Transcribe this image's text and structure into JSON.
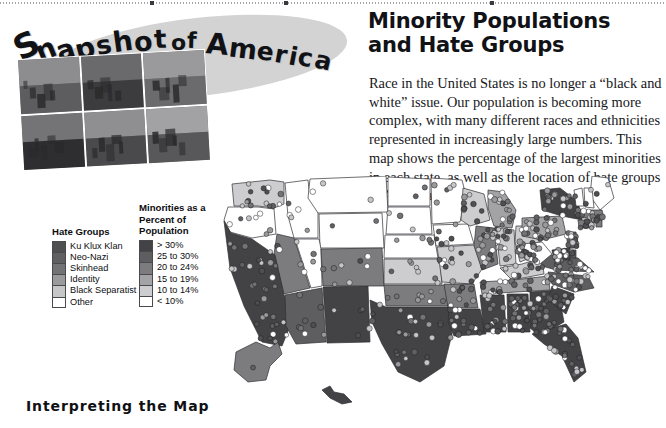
{
  "page": {
    "top_rule": "dotted-rule"
  },
  "logo": {
    "name": "Snapshot of America",
    "words": [
      {
        "text": "S",
        "x": 0,
        "y": 14,
        "size": 34,
        "rot": -26
      },
      {
        "text": "n",
        "x": 22,
        "y": 22,
        "size": 28,
        "rot": -22
      },
      {
        "text": "a",
        "x": 42,
        "y": 22,
        "size": 27,
        "rot": -18
      },
      {
        "text": "p",
        "x": 61,
        "y": 21,
        "size": 28,
        "rot": -14
      },
      {
        "text": "s",
        "x": 82,
        "y": 18,
        "size": 26,
        "rot": -11
      },
      {
        "text": "h",
        "x": 99,
        "y": 14,
        "size": 28,
        "rot": -8
      },
      {
        "text": "o",
        "x": 120,
        "y": 14,
        "size": 27,
        "rot": -5
      },
      {
        "text": "t",
        "x": 140,
        "y": 12,
        "size": 26,
        "rot": -3
      },
      {
        "text": "o",
        "x": 157,
        "y": 18,
        "size": 22,
        "rot": 0
      },
      {
        "text": "f",
        "x": 173,
        "y": 16,
        "size": 22,
        "rot": 2
      },
      {
        "text": "A",
        "x": 192,
        "y": 16,
        "size": 29,
        "rot": 5
      },
      {
        "text": "m",
        "x": 215,
        "y": 21,
        "size": 27,
        "rot": 7
      },
      {
        "text": "e",
        "x": 243,
        "y": 25,
        "size": 25,
        "rot": 9
      },
      {
        "text": "r",
        "x": 261,
        "y": 28,
        "size": 25,
        "rot": 10
      },
      {
        "text": "i",
        "x": 275,
        "y": 30,
        "size": 25,
        "rot": 11
      },
      {
        "text": "c",
        "x": 284,
        "y": 31,
        "size": 25,
        "rot": 12
      },
      {
        "text": "a",
        "x": 301,
        "y": 34,
        "size": 25,
        "rot": 13
      }
    ],
    "photos": [
      {
        "name": "village-valley-photo",
        "sky": "#8d8d8f",
        "land": "#5d5d5f"
      },
      {
        "name": "forest-trees-photo",
        "sky": "#6a6a6c",
        "land": "#3c3c3e"
      },
      {
        "name": "town-street-photo",
        "sky": "#9a9a9c",
        "land": "#6b6b6d"
      },
      {
        "name": "victorian-house-photo",
        "sky": "#747476",
        "land": "#2e2e30"
      },
      {
        "name": "barn-building-photo",
        "sky": "#8f8f91",
        "land": "#4a4a4c"
      },
      {
        "name": "farm-field-photo",
        "sky": "#a2a2a4",
        "land": "#58585a"
      }
    ]
  },
  "article": {
    "title": "Minority Populations and Hate Groups",
    "body": "Race in the United States is no longer a “black and white” issue. Our population is becoming more complex, with many different races and ethnicities represented in increasingly large numbers. This map shows the percentage of the largest minorities in each state, as well as the location of hate groups in America."
  },
  "legends": {
    "hate_groups": {
      "title": "Hate Groups",
      "items": [
        {
          "label": "Ku Klux Klan",
          "color": "#4f4f52"
        },
        {
          "label": "Neo-Nazi",
          "color": "#606063"
        },
        {
          "label": "Skinhead",
          "color": "#737376"
        },
        {
          "label": "Identity",
          "color": "#9a9a9d"
        },
        {
          "label": "Black Separatist",
          "color": "#c6c6c8"
        },
        {
          "label": "Other",
          "color": "#ffffff"
        }
      ]
    },
    "minorities": {
      "title": "Minorities as a\nPercent of\nPopulation",
      "items": [
        {
          "label": "> 30%",
          "color": "#434346"
        },
        {
          "label": "25 to 30%",
          "color": "#5e5e61"
        },
        {
          "label": "20 to 24%",
          "color": "#7c7c7f"
        },
        {
          "label": "15 to 19%",
          "color": "#a3a3a6"
        },
        {
          "label": "10 to 14%",
          "color": "#cdcdcf"
        },
        {
          "label": "< 10%",
          "color": "#ffffff"
        }
      ]
    }
  },
  "section": {
    "heading": "Interpreting the Map"
  },
  "chart_data": {
    "type": "map",
    "title": "Minority Populations and Hate Groups",
    "projection": "usa-albers-simplified",
    "view_box": "0 0 444 236",
    "legend_position": "left",
    "value_scale": [
      {
        "label": "> 30%",
        "color": "#434346"
      },
      {
        "label": "25 to 30%",
        "color": "#5e5e61"
      },
      {
        "label": "20 to 24%",
        "color": "#7c7c7f"
      },
      {
        "label": "15 to 19%",
        "color": "#a3a3a6"
      },
      {
        "label": "10 to 14%",
        "color": "#cdcdcf"
      },
      {
        "label": "< 10%",
        "color": "#ffffff"
      }
    ],
    "states": [
      {
        "code": "WA",
        "bucket": "10 to 14%",
        "color": "#cdcdcf",
        "points": "10,8 48,4 62,6 62,28 52,32 36,30 12,30"
      },
      {
        "code": "OR",
        "bucket": "< 10%",
        "color": "#ffffff",
        "points": "6,31 36,31 52,33 54,58 30,62 8,56 2,44"
      },
      {
        "code": "ID",
        "bucket": "< 10%",
        "color": "#ffffff",
        "points": "63,7 86,4 88,22 96,36 96,62 72,62 66,40"
      },
      {
        "code": "MT",
        "bucket": "< 10%",
        "color": "#ffffff",
        "points": "88,3 164,0 166,36 96,37 86,22"
      },
      {
        "code": "WY",
        "bucket": "< 10%",
        "color": "#ffffff",
        "points": "97,38 160,37 162,72 98,72"
      },
      {
        "code": "NV",
        "bucket": "20 to 24%",
        "color": "#7c7c7f",
        "points": "55,58 72,62 88,112 62,118 52,78"
      },
      {
        "code": "UT",
        "bucket": "< 10%",
        "color": "#ffffff",
        "points": "73,63 97,63 99,73 100,110 89,112"
      },
      {
        "code": "CA",
        "bucket": "> 30%",
        "color": "#434346",
        "points": "2,45 9,57 30,63 53,79 62,119 72,140 60,170 40,166 22,130 8,92"
      },
      {
        "code": "AZ",
        "bucket": "25 to 30%",
        "color": "#5e5e61",
        "points": "63,119 100,112 104,166 74,168 64,150"
      },
      {
        "code": "NM",
        "bucket": "> 30%",
        "color": "#434346",
        "points": "101,111 146,110 148,166 105,167"
      },
      {
        "code": "CO",
        "bucket": "20 to 24%",
        "color": "#7c7c7f",
        "points": "99,73 160,72 162,110 101,110"
      },
      {
        "code": "ND",
        "bucket": "< 10%",
        "color": "#ffffff",
        "points": "166,1 208,3 208,30 166,30"
      },
      {
        "code": "SD",
        "bucket": "< 10%",
        "color": "#ffffff",
        "points": "166,31 208,31 210,58 164,58"
      },
      {
        "code": "NE",
        "bucket": "< 10%",
        "color": "#ffffff",
        "points": "163,59 212,59 216,82 162,82"
      },
      {
        "code": "KS",
        "bucket": "10 to 14%",
        "color": "#cdcdcf",
        "points": "162,83 218,83 220,108 162,108"
      },
      {
        "code": "OK",
        "bucket": "20 to 24%",
        "color": "#7c7c7f",
        "points": "162,109 224,109 226,130 164,130"
      },
      {
        "code": "TX",
        "bucket": "> 30%",
        "color": "#434346",
        "points": "148,124 164,131 226,131 230,158 222,190 198,206 176,196 160,168 150,146"
      },
      {
        "code": "MN",
        "bucket": "< 10%",
        "color": "#ffffff",
        "points": "209,2 240,4 244,20 238,46 210,48"
      },
      {
        "code": "IA",
        "bucket": "< 10%",
        "color": "#ffffff",
        "points": "211,49 246,48 252,68 214,70"
      },
      {
        "code": "MO",
        "bucket": "10 to 14%",
        "color": "#cdcdcf",
        "points": "215,71 254,69 262,90 250,108 220,106 217,84"
      },
      {
        "code": "AR",
        "bucket": "20 to 24%",
        "color": "#7c7c7f",
        "points": "222,108 252,108 256,132 226,132"
      },
      {
        "code": "LA",
        "bucket": "> 30%",
        "color": "#434346",
        "points": "227,133 258,133 264,158 232,160 226,146"
      },
      {
        "code": "WI",
        "bucket": "10 to 14%",
        "color": "#cdcdcf",
        "points": "241,12 262,18 268,44 248,50 239,44"
      },
      {
        "code": "IL",
        "bucket": "20 to 24%",
        "color": "#7c7c7f",
        "points": "254,50 272,52 276,88 260,94 252,70"
      },
      {
        "code": "MI",
        "bucket": "15 to 19%",
        "color": "#a3a3a6",
        "points": "266,14 282,16 294,34 290,52 272,50 266,32"
      },
      {
        "code": "IN",
        "bucket": "10 to 14%",
        "color": "#cdcdcf",
        "points": "274,52 292,54 294,88 278,90"
      },
      {
        "code": "OH",
        "bucket": "10 to 14%",
        "color": "#cdcdcf",
        "points": "294,50 316,50 318,78 298,86 293,66"
      },
      {
        "code": "KY",
        "bucket": "10 to 14%",
        "color": "#cdcdcf",
        "points": "278,92 300,88 320,82 322,98 290,104"
      },
      {
        "code": "TN",
        "bucket": "15 to 19%",
        "color": "#a3a3a6",
        "points": "258,106 292,104 326,100 328,114 260,118"
      },
      {
        "code": "MS",
        "bucket": "> 30%",
        "color": "#434346",
        "points": "258,119 282,119 284,156 262,156"
      },
      {
        "code": "AL",
        "bucket": "> 30%",
        "color": "#434346",
        "points": "285,118 306,118 308,156 286,156"
      },
      {
        "code": "GA",
        "bucket": "> 30%",
        "color": "#434346",
        "points": "308,116 336,114 342,146 318,160 308,152"
      },
      {
        "code": "FL",
        "bucket": "> 30%",
        "color": "#434346",
        "points": "310,158 344,148 356,162 364,196 352,206 340,180 322,168"
      },
      {
        "code": "SC",
        "bucket": "> 30%",
        "color": "#434346",
        "points": "330,110 352,118 344,138 326,124"
      },
      {
        "code": "NC",
        "bucket": "25 to 30%",
        "color": "#5e5e61",
        "points": "326,96 366,100 372,112 352,116 330,108"
      },
      {
        "code": "VA",
        "bucket": "25 to 30%",
        "color": "#5e5e61",
        "points": "318,78 356,82 372,96 334,94 320,90"
      },
      {
        "code": "WV",
        "bucket": "< 10%",
        "color": "#ffffff",
        "points": "300,68 320,66 330,78 318,88 304,84"
      },
      {
        "code": "PA",
        "bucket": "15 to 19%",
        "color": "#a3a3a6",
        "points": "300,42 340,40 344,58 320,64 300,60"
      },
      {
        "code": "NY",
        "bucket": "> 30%",
        "color": "#434346",
        "points": "318,14 338,12 356,26 360,44 340,40 320,34"
      },
      {
        "code": "ME",
        "bucket": "< 10%",
        "color": "#ffffff",
        "points": "370,0 386,2 392,22 378,34 368,20"
      },
      {
        "code": "VT",
        "bucket": "< 10%",
        "color": "#ffffff",
        "points": "352,14 360,12 362,30 354,30"
      },
      {
        "code": "NH",
        "bucket": "< 10%",
        "color": "#ffffff",
        "points": "362,12 370,12 372,32 363,31"
      },
      {
        "code": "MA",
        "bucket": "20 to 24%",
        "color": "#7c7c7f",
        "points": "356,34 380,34 382,42 357,42"
      },
      {
        "code": "CT",
        "bucket": "20 to 24%",
        "color": "#7c7c7f",
        "points": "356,44 372,44 372,52 357,52"
      },
      {
        "code": "RI",
        "bucket": "20 to 24%",
        "color": "#7c7c7f",
        "points": "374,44 380,44 380,51 374,51"
      },
      {
        "code": "NJ",
        "bucket": "25 to 30%",
        "color": "#5e5e61",
        "points": "344,56 354,56 356,72 346,72"
      },
      {
        "code": "DE",
        "bucket": "25 to 30%",
        "color": "#5e5e61",
        "points": "346,74 354,74 354,82 347,82"
      },
      {
        "code": "MD",
        "bucket": "> 30%",
        "color": "#434346",
        "points": "330,74 348,72 348,84 332,84"
      },
      {
        "code": "AK",
        "bucket": "20 to 24%",
        "color": "#7c7c7f",
        "points": "14,176 34,166 48,172 56,166 60,178 48,190 44,204 26,206 12,194"
      },
      {
        "code": "HI",
        "bucket": "> 30%",
        "color": "#434346",
        "points": "100,214 108,210 112,216 122,218 130,226 120,228 108,222"
      }
    ],
    "hate_group_dots": {
      "colors": [
        "#4f4f52",
        "#606063",
        "#737376",
        "#9a9a9d",
        "#c6c6c8",
        "#ffffff"
      ],
      "radius": 2.6,
      "note": "Each dot marks one hate group location",
      "density_regions": [
        {
          "region": "Pacific Northwest",
          "count": 34
        },
        {
          "region": "California",
          "count": 52
        },
        {
          "region": "Mountain West",
          "count": 26
        },
        {
          "region": "Great Plains",
          "count": 30
        },
        {
          "region": "Midwest",
          "count": 68
        },
        {
          "region": "Southeast",
          "count": 96
        },
        {
          "region": "Northeast",
          "count": 78
        },
        {
          "region": "Texas",
          "count": 30
        }
      ]
    }
  }
}
